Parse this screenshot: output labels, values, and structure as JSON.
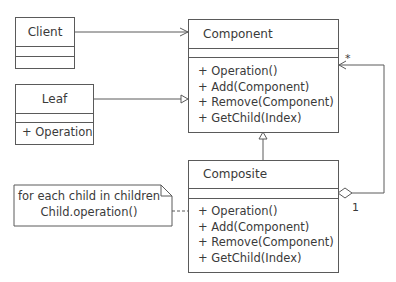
{
  "diagram": {
    "type": "UML class diagram",
    "classes": {
      "client": {
        "name": "Client",
        "operations": []
      },
      "leaf": {
        "name": "Leaf",
        "operations": [
          "+ Operation"
        ]
      },
      "component": {
        "name": "Component",
        "operations": [
          "+ Operation()",
          "+ Add(Component)",
          "+ Remove(Component)",
          "+ GetChild(Index)"
        ]
      },
      "composite": {
        "name": "Composite",
        "operations": [
          "+ Operation()",
          "+ Add(Component)",
          "+ Remove(Component)",
          "+ GetChild(Index)"
        ]
      }
    },
    "note": {
      "lines": [
        "for each child in children",
        "Child.operation()"
      ]
    },
    "relationships": [
      {
        "from": "Client",
        "to": "Component",
        "kind": "association"
      },
      {
        "from": "Leaf",
        "to": "Component",
        "kind": "generalization"
      },
      {
        "from": "Composite",
        "to": "Component",
        "kind": "generalization"
      },
      {
        "from": "Composite",
        "to": "Component",
        "kind": "aggregation",
        "multiplicity_whole": "1",
        "multiplicity_part": "*"
      },
      {
        "from": "Note",
        "to": "Composite",
        "kind": "note-anchor"
      }
    ],
    "multiplicities": {
      "star": "*",
      "one": "1"
    },
    "colors": {
      "line": "#5a5a5a",
      "text": "#3a3a3a",
      "background": "#ffffff"
    }
  }
}
